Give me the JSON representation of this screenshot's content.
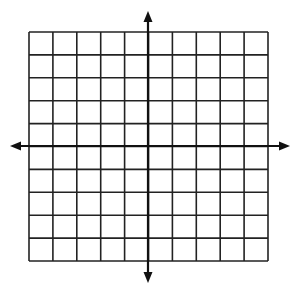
{
  "diagram": {
    "type": "coordinate-plane-grid",
    "grid": {
      "columns": 10,
      "rows": 10,
      "left": 29,
      "top": 32,
      "right": 268,
      "bottom": 261,
      "line_color": "#222222",
      "line_width": 1.6
    },
    "axes": {
      "origin_x": 148,
      "origin_y": 146,
      "x_axis": {
        "start": 10,
        "end": 290
      },
      "y_axis": {
        "start": 11,
        "end": 283
      },
      "color": "#111111",
      "width": 2.2,
      "arrowheads": [
        "left",
        "right",
        "up",
        "down"
      ]
    },
    "background": "#ffffff"
  }
}
